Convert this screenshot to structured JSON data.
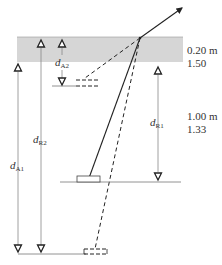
{
  "diagram": {
    "type": "anchor-geometry-schematic",
    "colors": {
      "band": "#d6d6d6",
      "line": "#222222",
      "thin": "#777777",
      "text": "#333333"
    },
    "layer_top": {
      "thickness": "0.20 m",
      "factor": "1.50"
    },
    "layer_middle": {
      "thickness": "1.00 m",
      "factor": "1.33"
    },
    "dimensions": [
      {
        "id": "dA1",
        "letter": "d",
        "sub": "A1"
      },
      {
        "id": "dR2",
        "letter": "d",
        "sub": "R2"
      },
      {
        "id": "dA2",
        "letter": "d",
        "sub": "A2"
      },
      {
        "id": "dR1",
        "letter": "d",
        "sub": "R1"
      }
    ]
  }
}
